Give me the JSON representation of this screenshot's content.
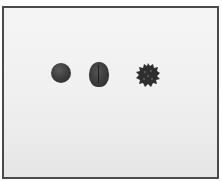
{
  "image": {
    "description": "Photograph of three dark seeds on a light background inside a thin dark frame",
    "objects": [
      {
        "name": "round-seed",
        "shape": "round"
      },
      {
        "name": "oval-seed",
        "shape": "oval with central groove"
      },
      {
        "name": "spiky-seed",
        "shape": "bumpy/spiky"
      }
    ],
    "colors": {
      "frame": "#4a4a4a",
      "background": "#f0f0f0",
      "seed": "#333333"
    }
  }
}
